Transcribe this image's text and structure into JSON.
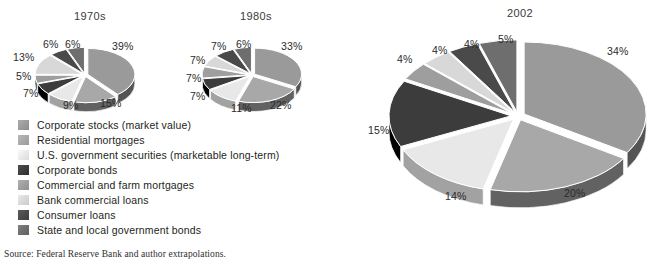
{
  "source_note": "Source: Federal Reserve Bank and author extrapolations.",
  "legend": {
    "items": [
      {
        "label": "Corporate stocks (market value)",
        "color": "#9a9a9a"
      },
      {
        "label": "Residential mortgages",
        "color": "#a8a8a8"
      },
      {
        "label": "U.S. government securities (marketable long-term)",
        "color": "#e8e8e8"
      },
      {
        "label": "Corporate bonds",
        "color": "#3c3c3c"
      },
      {
        "label": "Commercial and farm mortgages",
        "color": "#9e9e9e"
      },
      {
        "label": "Bank commercial loans",
        "color": "#d8d8d8"
      },
      {
        "label": "Consumer loans",
        "color": "#4a4a4a"
      },
      {
        "label": "State and local government bonds",
        "color": "#6e6e6e"
      }
    ]
  },
  "chart_data": [
    {
      "type": "pie",
      "title": "1970s",
      "categories": [
        "Corporate stocks (market value)",
        "Residential mortgages",
        "U.S. government securities (marketable long-term)",
        "Corporate bonds",
        "Commercial and farm mortgages",
        "Bank commercial loans",
        "Consumer loans",
        "State and local government bonds"
      ],
      "values": [
        39,
        15,
        9,
        7,
        5,
        13,
        6,
        6
      ],
      "labels": [
        "39%",
        "15%",
        "9%",
        "7%",
        "5%",
        "13%",
        "6%",
        "6%"
      ],
      "colors": [
        "#9a9a9a",
        "#a8a8a8",
        "#e8e8e8",
        "#3c3c3c",
        "#9e9e9e",
        "#d8d8d8",
        "#4a4a4a",
        "#6e6e6e"
      ],
      "legend_position": "below",
      "exploded": true
    },
    {
      "type": "pie",
      "title": "1980s",
      "categories": [
        "Corporate stocks (market value)",
        "Residential mortgages",
        "U.S. government securities (marketable long-term)",
        "Corporate bonds",
        "Commercial and farm mortgages",
        "Bank commercial loans",
        "Consumer loans",
        "State and local government bonds"
      ],
      "values": [
        33,
        22,
        11,
        7,
        7,
        7,
        7,
        6
      ],
      "labels": [
        "33%",
        "22%",
        "11%",
        "7%",
        "7%",
        "7%",
        "7%",
        "6%"
      ],
      "colors": [
        "#9a9a9a",
        "#a8a8a8",
        "#e8e8e8",
        "#3c3c3c",
        "#9e9e9e",
        "#d8d8d8",
        "#4a4a4a",
        "#6e6e6e"
      ],
      "legend_position": "below",
      "exploded": true
    },
    {
      "type": "pie",
      "title": "2002",
      "categories": [
        "Corporate stocks (market value)",
        "Residential mortgages",
        "U.S. government securities (marketable long-term)",
        "Corporate bonds",
        "Commercial and farm mortgages",
        "Bank commercial loans",
        "Consumer loans",
        "State and local government bonds"
      ],
      "values": [
        34,
        20,
        14,
        15,
        4,
        4,
        4,
        5
      ],
      "labels": [
        "34%",
        "20%",
        "14%",
        "15%",
        "4%",
        "4%",
        "4%",
        "5%"
      ],
      "colors": [
        "#9a9a9a",
        "#a8a8a8",
        "#e8e8e8",
        "#3c3c3c",
        "#9e9e9e",
        "#d8d8d8",
        "#4a4a4a",
        "#6e6e6e"
      ],
      "legend_position": "below",
      "exploded": true
    }
  ],
  "pies": {
    "p1970": {
      "title": "1970s",
      "title_pos": {
        "x": 74,
        "y": 10
      },
      "cx": 85,
      "cy": 75,
      "rx": 47,
      "ry": 26,
      "depth": 9,
      "explode": 3,
      "start_angle": -90,
      "labels": [
        {
          "text": "39%",
          "x": 112,
          "y": 40
        },
        {
          "text": "15%",
          "x": 100,
          "y": 97
        },
        {
          "text": "9%",
          "x": 63,
          "y": 99
        },
        {
          "text": "7%",
          "x": 23,
          "y": 87
        },
        {
          "text": "5%",
          "x": 16,
          "y": 70
        },
        {
          "text": "13%",
          "x": 13,
          "y": 51
        },
        {
          "text": "6%",
          "x": 43,
          "y": 38
        },
        {
          "text": "6%",
          "x": 65,
          "y": 38
        }
      ]
    },
    "p1980": {
      "title": "1980s",
      "title_pos": {
        "x": 240,
        "y": 10
      },
      "cx": 252,
      "cy": 75,
      "rx": 47,
      "ry": 26,
      "depth": 9,
      "explode": 3,
      "start_angle": -90,
      "labels": [
        {
          "text": "33%",
          "x": 281,
          "y": 40
        },
        {
          "text": "22%",
          "x": 270,
          "y": 99
        },
        {
          "text": "11%",
          "x": 231,
          "y": 102
        },
        {
          "text": "7%",
          "x": 190,
          "y": 90
        },
        {
          "text": "7%",
          "x": 186,
          "y": 72
        },
        {
          "text": "7%",
          "x": 190,
          "y": 54
        },
        {
          "text": "7%",
          "x": 211,
          "y": 40
        },
        {
          "text": "6%",
          "x": 236,
          "y": 38
        }
      ]
    },
    "p2002": {
      "title": "2002",
      "title_pos": {
        "x": 507,
        "y": 7
      },
      "cx": 518,
      "cy": 116,
      "rx": 122,
      "ry": 72,
      "depth": 16,
      "explode": 7,
      "start_angle": -90,
      "labels": [
        {
          "text": "34%",
          "x": 607,
          "y": 45
        },
        {
          "text": "20%",
          "x": 564,
          "y": 187
        },
        {
          "text": "14%",
          "x": 445,
          "y": 190
        },
        {
          "text": "15%",
          "x": 368,
          "y": 124
        },
        {
          "text": "4%",
          "x": 397,
          "y": 53
        },
        {
          "text": "4%",
          "x": 432,
          "y": 44
        },
        {
          "text": "4%",
          "x": 464,
          "y": 38
        },
        {
          "text": "5%",
          "x": 498,
          "y": 33
        }
      ]
    }
  }
}
